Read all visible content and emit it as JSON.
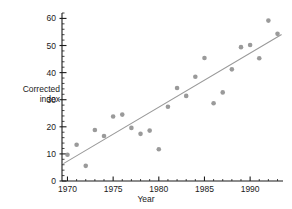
{
  "chart_data": {
    "type": "scatter",
    "title": "",
    "xlabel": "Year",
    "ylabel": "Corrected index",
    "ylabel_lines": [
      "Corrected",
      "index"
    ],
    "xlim": [
      1969.4,
      1993.6
    ],
    "ylim": [
      0,
      62
    ],
    "xticks": [
      1970,
      1975,
      1980,
      1985,
      1990
    ],
    "xtick_labels": [
      "1970",
      "1975",
      "1980",
      "1985",
      "1990"
    ],
    "x_minor_tick_step": 1,
    "yticks": [
      0,
      10,
      20,
      30,
      40,
      50,
      60
    ],
    "ytick_labels": [
      "0",
      "10",
      "20",
      "30",
      "40",
      "50",
      "60"
    ],
    "y_minor_tick_step": 2,
    "grid": false,
    "legend": null,
    "marker": "circle",
    "marker_color": "#9a9a9a",
    "marker_size": 4.6,
    "line_color": "#9a9a9a",
    "axis_color": "#1a1a1a",
    "points": [
      {
        "x": 1970,
        "y": 9.7
      },
      {
        "x": 1971,
        "y": 13.4
      },
      {
        "x": 1972,
        "y": 5.6
      },
      {
        "x": 1973,
        "y": 18.8
      },
      {
        "x": 1974,
        "y": 16.6
      },
      {
        "x": 1975,
        "y": 23.8
      },
      {
        "x": 1976,
        "y": 24.5
      },
      {
        "x": 1977,
        "y": 19.6
      },
      {
        "x": 1978,
        "y": 17.4
      },
      {
        "x": 1979,
        "y": 18.6
      },
      {
        "x": 1980,
        "y": 11.7
      },
      {
        "x": 1981,
        "y": 27.4
      },
      {
        "x": 1982,
        "y": 34.3
      },
      {
        "x": 1983,
        "y": 31.4
      },
      {
        "x": 1984,
        "y": 38.5
      },
      {
        "x": 1985,
        "y": 45.4
      },
      {
        "x": 1986,
        "y": 28.7
      },
      {
        "x": 1987,
        "y": 32.7
      },
      {
        "x": 1988,
        "y": 41.2
      },
      {
        "x": 1989,
        "y": 49.4
      },
      {
        "x": 1990,
        "y": 50.2
      },
      {
        "x": 1991,
        "y": 45.3
      },
      {
        "x": 1992,
        "y": 59.2
      },
      {
        "x": 1993,
        "y": 54.3
      }
    ],
    "trend_line": {
      "type": "linear-fit",
      "x_start": 1969.6,
      "y_start": 6.5,
      "x_end": 1993.4,
      "y_end": 54.0
    }
  }
}
